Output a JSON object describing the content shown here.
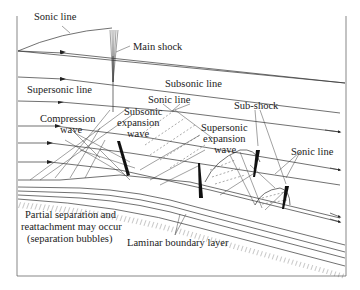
{
  "diagram": {
    "labels": {
      "sonic_line_top": "Sonic line",
      "main_shock": "Main shock",
      "subsonic_line": "Subsonic line",
      "supersonic_line": "Supersonic line",
      "sonic_line_mid": "Sonic line",
      "sub_shock": "Sub-shock",
      "compression_wave_1": "Compression",
      "compression_wave_2": "wave",
      "subsonic_expansion_1": "Subsonic",
      "subsonic_expansion_2": "expansion",
      "subsonic_expansion_3": "wave",
      "supersonic_expansion_1": "Supersonic",
      "supersonic_expansion_2": "expansion",
      "supersonic_expansion_3": "wave",
      "sonic_line_right": "Sonic line",
      "separation_1": "Partial separation and",
      "separation_2": "reattachment may occur",
      "separation_3": "(separation bubbles)",
      "laminar_boundary_layer": "Laminar boundary layer"
    }
  }
}
